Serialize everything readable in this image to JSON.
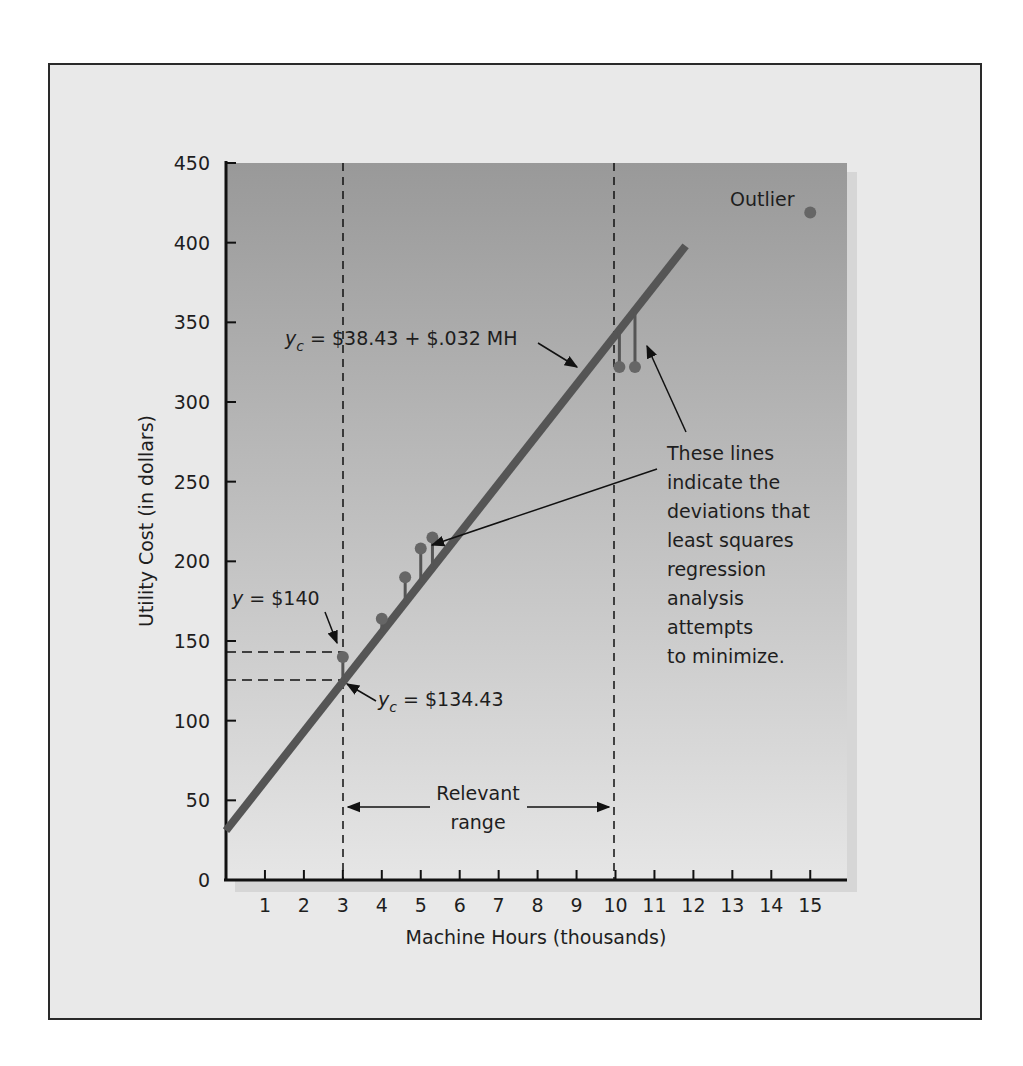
{
  "figure": {
    "plot_background": {
      "top_color": "#999999",
      "bottom_color": "#e6e6e6"
    },
    "line_color": "#555555",
    "point_color": "#666666"
  },
  "annotations": {
    "outlier_label": "Outlier",
    "equation_prefix": "y",
    "equation_sub": "c",
    "equation_rest": " = $38.43 + $.032 MH",
    "y_actual_prefix": "y",
    "y_actual_rest": " = $140",
    "yc_point_prefix": "y",
    "yc_point_sub": "c",
    "yc_point_rest": " = $134.43",
    "relevant_range_line1": "Relevant",
    "relevant_range_line2": "range",
    "deviation_note": [
      "These lines",
      "indicate the",
      "deviations that",
      "least squares",
      "regression",
      "analysis",
      "attempts",
      "to minimize."
    ]
  },
  "chart_data": {
    "type": "scatter",
    "title": "",
    "xlabel": "Machine Hours (thousands)",
    "ylabel": "Utility Cost (in dollars)",
    "xlim": [
      0,
      16
    ],
    "ylim": [
      0,
      450
    ],
    "x_ticks": [
      1,
      2,
      3,
      4,
      5,
      6,
      7,
      8,
      9,
      10,
      11,
      12,
      13,
      14,
      15
    ],
    "y_ticks": [
      0,
      50,
      100,
      150,
      200,
      250,
      300,
      350,
      400,
      450
    ],
    "grid": false,
    "legend": null,
    "series": [
      {
        "name": "Observed utility cost",
        "points": [
          {
            "x": 3.0,
            "y": 140
          },
          {
            "x": 4.0,
            "y": 164
          },
          {
            "x": 4.6,
            "y": 190
          },
          {
            "x": 5.0,
            "y": 208
          },
          {
            "x": 5.3,
            "y": 215
          },
          {
            "x": 10.1,
            "y": 322
          },
          {
            "x": 10.5,
            "y": 322
          }
        ]
      },
      {
        "name": "Outlier",
        "points": [
          {
            "x": 15.0,
            "y": 419
          }
        ]
      }
    ],
    "regression_line": {
      "equation": "yc = $38.43 + $.032 MH",
      "intercept": 38.43,
      "slope_per_thousand_mh": 32,
      "x_start": 0,
      "x_end": 11.8
    },
    "relevant_range": {
      "x_min": 3,
      "x_max": 10,
      "label": "Relevant range"
    },
    "reference_values": {
      "y_actual_at_3": 140,
      "yc_at_3": 134.43
    }
  }
}
